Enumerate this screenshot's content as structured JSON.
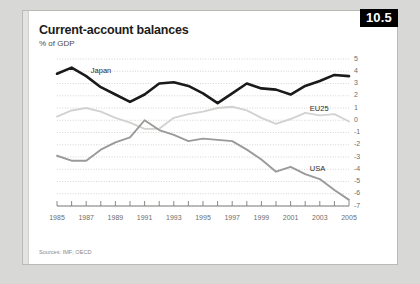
{
  "badge": {
    "label": "10.5"
  },
  "header": {
    "title": "Current-account balances",
    "subtitle": "% of GDP"
  },
  "footer": {
    "source": "Sources: IMF; OECD"
  },
  "series_labels": {
    "japan": "Japan",
    "eu25": "EU25",
    "usa": "USA"
  },
  "colors": {
    "japan": "#1a1a1a",
    "usa": "#9a9a98",
    "eu25": "#d2d2d0",
    "grid": "#c9c9c7",
    "axis": "#7d7d7b",
    "badge_bg": "#000000",
    "badge_fg": "#ffffff",
    "card_bg": "#ffffff",
    "page_bg": "#d8d8d6"
  },
  "chart_data": {
    "type": "line",
    "title": "Current-account balances",
    "subtitle": "% of GDP",
    "xlabel": "",
    "ylabel": "% of GDP",
    "ylim": [
      -7,
      5
    ],
    "yticks": [
      5,
      4,
      3,
      2,
      1,
      0,
      -1,
      -2,
      -3,
      -4,
      -5,
      -6,
      -7
    ],
    "ytick_labels": [
      "5",
      "4",
      "3",
      "2",
      "1",
      "0",
      "-1",
      "-2",
      "-3",
      "-4",
      "-5",
      "-6",
      "-7"
    ],
    "xlim": [
      1985,
      2005
    ],
    "x": [
      1985,
      1986,
      1987,
      1988,
      1989,
      1990,
      1991,
      1992,
      1993,
      1994,
      1995,
      1996,
      1997,
      1998,
      1999,
      2000,
      2001,
      2002,
      2003,
      2004,
      2005
    ],
    "xtick_labels": [
      "1985",
      "1987",
      "1989",
      "1991",
      "1993",
      "1995",
      "1997",
      "1999",
      "2001",
      "2003",
      "2005"
    ],
    "xticks_labeled": [
      1985,
      1987,
      1989,
      1991,
      1993,
      1995,
      1997,
      1999,
      2001,
      2003,
      2005
    ],
    "grid": true,
    "grid_style": "dotted-horizontal",
    "legend_position": "inline-annotations",
    "yaxis_position": "right",
    "series": [
      {
        "name": "Japan",
        "color": "#1a1a1a",
        "width": "thick",
        "values": [
          3.8,
          4.3,
          3.6,
          2.7,
          2.1,
          1.5,
          2.1,
          3.0,
          3.1,
          2.8,
          2.2,
          1.4,
          2.2,
          3.0,
          2.6,
          2.5,
          2.1,
          2.8,
          3.2,
          3.7,
          3.6
        ]
      },
      {
        "name": "EU25",
        "color": "#d2d2d0",
        "width": "medium",
        "values": [
          0.3,
          0.8,
          1.0,
          0.7,
          0.2,
          -0.2,
          -0.7,
          -0.7,
          0.2,
          0.5,
          0.7,
          1.0,
          1.1,
          0.8,
          0.2,
          -0.3,
          0.1,
          0.6,
          0.4,
          0.5,
          -0.1
        ]
      },
      {
        "name": "USA",
        "color": "#9a9a98",
        "width": "medium",
        "values": [
          -2.9,
          -3.3,
          -3.3,
          -2.4,
          -1.8,
          -1.4,
          0.0,
          -0.8,
          -1.2,
          -1.7,
          -1.5,
          -1.6,
          -1.7,
          -2.4,
          -3.2,
          -4.2,
          -3.8,
          -4.4,
          -4.8,
          -5.7,
          -6.5
        ]
      }
    ],
    "annotations": [
      {
        "text": "Japan",
        "x": 1988,
        "y": 3.6
      },
      {
        "text": "EU25",
        "x": 2003,
        "y": 0.5
      },
      {
        "text": "USA",
        "x": 2003,
        "y": -4.4
      }
    ]
  }
}
